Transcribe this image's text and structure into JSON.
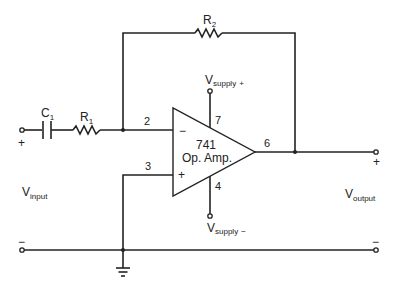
{
  "diagram": {
    "type": "inverting op-amp circuit with AC-coupled input",
    "components": {
      "capacitor": {
        "name": "C",
        "subscript": "1"
      },
      "input_resistor": {
        "name": "R",
        "subscript": "1"
      },
      "feedback_resistor": {
        "name": "R",
        "subscript": "2"
      },
      "opamp": {
        "line1": "741",
        "line2": "Op. Amp.",
        "inv_sign": "−",
        "noninv_sign": "+"
      }
    },
    "pins": {
      "inverting": "2",
      "noninverting": "3",
      "output": "6",
      "vpos": "7",
      "vneg": "4"
    },
    "supply": {
      "positive": {
        "main": "V",
        "sub": "supply",
        "sign": "+"
      },
      "negative": {
        "main": "V",
        "sub": "supply",
        "sign": "−"
      }
    },
    "input": {
      "main": "V",
      "sub": "input",
      "plus": "+",
      "minus": "−"
    },
    "output": {
      "main": "V",
      "sub": "output",
      "plus": "+",
      "minus": "−"
    },
    "colors": {
      "line": "#222222",
      "background": "#ffffff"
    }
  }
}
